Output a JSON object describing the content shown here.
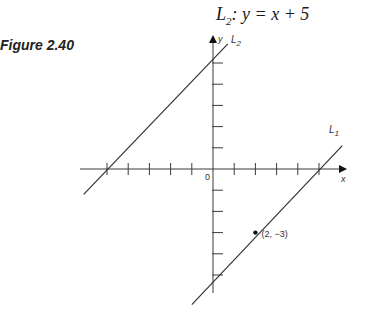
{
  "header": {
    "equation_label": "L",
    "equation_sub": "2",
    "equation_rest": ": y = x + 5"
  },
  "figure": {
    "label": "Figure 2.40"
  },
  "chart_data": {
    "type": "line",
    "title": "L2: y = x + 5",
    "xlabel": "x",
    "ylabel": "y",
    "origin_label": "0",
    "xlim": [
      -6.2,
      6.2
    ],
    "ylim": [
      -6,
      6.2
    ],
    "grid": false,
    "x_ticks": [
      -5,
      -4,
      -3,
      -2,
      -1,
      1,
      2,
      3,
      4,
      5
    ],
    "y_ticks": [
      -5,
      -4,
      -3,
      -2,
      -1,
      1,
      2,
      3,
      4,
      5
    ],
    "series": [
      {
        "name": "L2",
        "label": "L2",
        "equation": "y = x + 5",
        "x": [
          -6.1,
          0.7
        ],
        "y": [
          -1.2,
          5.9
        ]
      },
      {
        "name": "L1",
        "label": "L1",
        "equation": "y = x - 5",
        "x": [
          -1.0,
          6.1
        ],
        "y": [
          -6.4,
          1.1
        ]
      }
    ],
    "annotations": [
      {
        "point": [
          2,
          -3
        ],
        "text": "(2, −3)"
      }
    ]
  }
}
